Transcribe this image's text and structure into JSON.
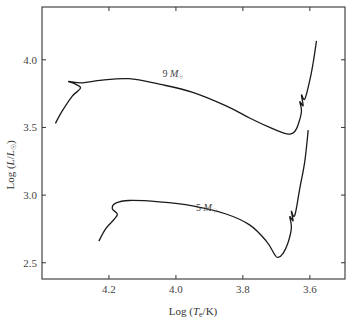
{
  "chart_data": {
    "type": "line",
    "title": "",
    "xlabel": "Log (T_e/K)",
    "ylabel": "Log (L/L☉)",
    "x_inverted": true,
    "xlim": [
      4.4,
      3.495
    ],
    "ylim": [
      2.38,
      4.39
    ],
    "xticks": [
      4.2,
      4.0,
      3.8,
      3.6
    ],
    "xtick_labels": [
      "4.2",
      "4.0",
      "3.8",
      "3.6"
    ],
    "yticks": [
      2.5,
      3.0,
      3.5,
      4.0
    ],
    "ytick_labels": [
      "2.5",
      "3.0",
      "3.5",
      "4.0"
    ],
    "grid": false,
    "legend": "none (inline labels)",
    "series": [
      {
        "name": "9 M☉",
        "label_text": "9 M",
        "label_pos": [
          4.04,
          3.87
        ],
        "x": [
          4.36,
          4.34,
          4.31,
          4.285,
          4.3,
          4.32,
          4.28,
          4.22,
          4.14,
          4.05,
          3.95,
          3.85,
          3.78,
          3.72,
          3.68,
          3.66,
          3.645,
          3.635,
          3.625,
          3.63,
          3.62,
          3.625,
          3.615,
          3.6,
          3.59,
          3.58
        ],
        "y": [
          3.53,
          3.62,
          3.73,
          3.79,
          3.82,
          3.84,
          3.83,
          3.85,
          3.86,
          3.82,
          3.76,
          3.66,
          3.57,
          3.5,
          3.46,
          3.45,
          3.47,
          3.52,
          3.62,
          3.69,
          3.66,
          3.74,
          3.71,
          3.85,
          3.98,
          4.14
        ]
      },
      {
        "name": "5 M☉",
        "label_text": "5 M",
        "label_pos": [
          3.94,
          2.88
        ],
        "x": [
          4.23,
          4.21,
          4.185,
          4.175,
          4.19,
          4.18,
          4.14,
          4.05,
          3.95,
          3.85,
          3.78,
          3.73,
          3.705,
          3.695,
          3.68,
          3.665,
          3.655,
          3.66,
          3.65,
          3.655,
          3.645,
          3.63,
          3.615,
          3.605
        ],
        "y": [
          2.66,
          2.75,
          2.82,
          2.86,
          2.9,
          2.94,
          2.96,
          2.95,
          2.92,
          2.86,
          2.78,
          2.66,
          2.56,
          2.54,
          2.57,
          2.65,
          2.76,
          2.84,
          2.81,
          2.88,
          2.85,
          3.05,
          3.25,
          3.48
        ]
      }
    ]
  },
  "axes": {
    "x_label_prefix": "Log (",
    "x_label_var": "T",
    "x_label_sub": "e",
    "x_label_suffix": "/K)",
    "y_label_prefix": "Log (",
    "y_label_var": "L",
    "y_label_mid": "/",
    "y_label_var2": "L",
    "y_label_sub": "☉",
    "y_label_suffix": ")"
  },
  "styles": {
    "line_color": "#1a1a1a",
    "frame_color": "#333333"
  }
}
